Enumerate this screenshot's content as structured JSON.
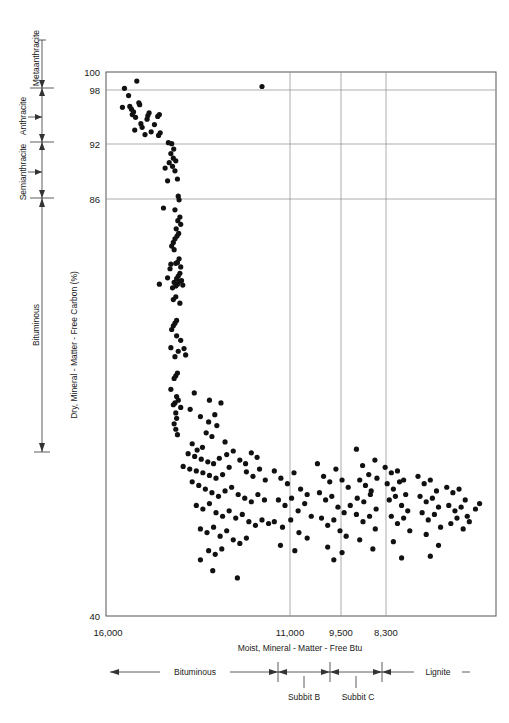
{
  "chart_data": {
    "type": "scatter",
    "title": "",
    "xlabel": "Moist, Mineral - Matter - Free Btu",
    "ylabel": "Dry, Mineral - Matter - Free Carbon (%)",
    "xlim": [
      16000,
      6500
    ],
    "ylim": [
      40,
      100
    ],
    "x_reversed": true,
    "grid": true,
    "legend_position": "none",
    "xticks": [
      {
        "label": "16,000",
        "value": 16000
      },
      {
        "label": "11,000",
        "value": 11000
      },
      {
        "label": "9,500",
        "value": 9500
      },
      {
        "label": "8,300",
        "value": 8300
      }
    ],
    "yticks": [
      {
        "label": "100",
        "value": 100
      },
      {
        "label": "98",
        "value": 98
      },
      {
        "label": "92",
        "value": 92
      },
      {
        "label": "86",
        "value": 86
      },
      {
        "label": "40",
        "value": 40
      }
    ],
    "gridlines_y": [
      98,
      92,
      86
    ],
    "gridlines_x": [
      11000,
      9500,
      8300
    ],
    "rank_axis_left": {
      "categories": [
        {
          "label": "Metaanthracite",
          "min": 98,
          "max": 100
        },
        {
          "label": "Anthracite",
          "min": 92,
          "max": 98
        },
        {
          "label": "Semianthracite",
          "min": 86,
          "max": 92
        },
        {
          "label": "Bituminous",
          "min": 40,
          "max": 86
        }
      ]
    },
    "rank_axis_bottom": {
      "categories": [
        {
          "label": "Bituminous",
          "from": 16000,
          "to": 10500
        },
        {
          "label": "Subbit B",
          "from": 10500,
          "to": 9500
        },
        {
          "label": "Subbit C",
          "from": 9500,
          "to": 8300
        },
        {
          "label": "Lignite",
          "from": 8300,
          "to": 6500
        }
      ]
    },
    "series": [
      {
        "name": "coal samples",
        "marker": "filled-circle",
        "color": "#111111",
        "points": [
          [
            15550,
            98.2
          ],
          [
            15250,
            99.0
          ],
          [
            15450,
            97.4
          ],
          [
            15200,
            96.6
          ],
          [
            15180,
            96.4
          ],
          [
            15420,
            96.2
          ],
          [
            15600,
            96.1
          ],
          [
            15380,
            95.9
          ],
          [
            15330,
            95.6
          ],
          [
            15360,
            95.3
          ],
          [
            15280,
            95.0
          ],
          [
            14950,
            95.5
          ],
          [
            14980,
            95.2
          ],
          [
            15000,
            94.8
          ],
          [
            14700,
            95.3
          ],
          [
            14740,
            95.1
          ],
          [
            15150,
            94.3
          ],
          [
            15120,
            93.9
          ],
          [
            14820,
            94.2
          ],
          [
            15300,
            93.6
          ],
          [
            14680,
            93.3
          ],
          [
            14720,
            93.0
          ],
          [
            14900,
            93.4
          ],
          [
            15050,
            93.1
          ],
          [
            14400,
            92.1
          ],
          [
            14480,
            92.2
          ],
          [
            14350,
            91.5
          ],
          [
            14420,
            91.0
          ],
          [
            14360,
            90.5
          ],
          [
            14300,
            90.2
          ],
          [
            14460,
            90.0
          ],
          [
            14380,
            89.6
          ],
          [
            14320,
            89.1
          ],
          [
            14560,
            89.4
          ],
          [
            14260,
            88.2
          ],
          [
            14500,
            88.0
          ],
          [
            14240,
            86.3
          ],
          [
            14220,
            85.9
          ],
          [
            14320,
            84.8
          ],
          [
            14600,
            85.0
          ],
          [
            14200,
            84.0
          ],
          [
            14250,
            83.6
          ],
          [
            14180,
            83.2
          ],
          [
            14290,
            82.7
          ],
          [
            14230,
            82.2
          ],
          [
            14270,
            81.9
          ],
          [
            14320,
            81.6
          ],
          [
            14360,
            81.2
          ],
          [
            14400,
            80.8
          ],
          [
            14340,
            80.4
          ],
          [
            14220,
            79.4
          ],
          [
            14260,
            79.0
          ],
          [
            14300,
            78.9
          ],
          [
            14180,
            78.5
          ],
          [
            14420,
            78.8
          ],
          [
            14440,
            78.3
          ],
          [
            14200,
            77.8
          ],
          [
            14240,
            77.5
          ],
          [
            14280,
            77.2
          ],
          [
            14220,
            76.9
          ],
          [
            14260,
            76.6
          ],
          [
            14300,
            76.4
          ],
          [
            14340,
            76.8
          ],
          [
            14380,
            76.2
          ],
          [
            14160,
            77.0
          ],
          [
            14500,
            77.3
          ],
          [
            14130,
            76.5
          ],
          [
            14700,
            76.6
          ],
          [
            14300,
            75.2
          ],
          [
            14360,
            74.9
          ],
          [
            14200,
            74.5
          ],
          [
            14280,
            72.6
          ],
          [
            14320,
            72.3
          ],
          [
            14360,
            72.0
          ],
          [
            14400,
            71.6
          ],
          [
            14280,
            70.9
          ],
          [
            14180,
            70.4
          ],
          [
            14100,
            69.5
          ],
          [
            14240,
            69.2
          ],
          [
            14420,
            69.6
          ],
          [
            14320,
            68.6
          ],
          [
            14060,
            68.8
          ],
          [
            14260,
            66.8
          ],
          [
            14300,
            66.5
          ],
          [
            14340,
            66.2
          ],
          [
            14420,
            65.0
          ],
          [
            14280,
            64.2
          ],
          [
            14240,
            63.8
          ],
          [
            14320,
            63.5
          ],
          [
            14180,
            63.0
          ],
          [
            14360,
            63.3
          ],
          [
            14300,
            62.4
          ],
          [
            14280,
            61.8
          ],
          [
            14340,
            61.2
          ],
          [
            14300,
            60.6
          ],
          [
            14260,
            60.0
          ],
          [
            13850,
            64.6
          ],
          [
            13700,
            62.0
          ],
          [
            13500,
            61.4
          ],
          [
            13300,
            61.0
          ],
          [
            13200,
            63.5
          ],
          [
            13560,
            60.2
          ],
          [
            13420,
            59.8
          ],
          [
            13100,
            59.2
          ],
          [
            13900,
            59.0
          ],
          [
            13650,
            58.6
          ],
          [
            13780,
            58.3
          ],
          [
            13480,
            63.8
          ],
          [
            13950,
            62.8
          ],
          [
            13350,
            62.2
          ],
          [
            14000,
            57.9
          ],
          [
            13840,
            57.6
          ],
          [
            13680,
            57.3
          ],
          [
            13520,
            57.0
          ],
          [
            13240,
            57.4
          ],
          [
            13380,
            56.8
          ],
          [
            14120,
            56.5
          ],
          [
            13960,
            56.2
          ],
          [
            13800,
            56.0
          ],
          [
            13640,
            55.8
          ],
          [
            13480,
            55.5
          ],
          [
            13320,
            55.2
          ],
          [
            13160,
            55.6
          ],
          [
            13000,
            56.4
          ],
          [
            13060,
            57.8
          ],
          [
            12900,
            58.2
          ],
          [
            12740,
            57.2
          ],
          [
            12600,
            56.8
          ],
          [
            12460,
            58.0
          ],
          [
            12320,
            57.5
          ],
          [
            12580,
            55.9
          ],
          [
            12420,
            55.4
          ],
          [
            12260,
            56.2
          ],
          [
            12120,
            55.0
          ],
          [
            13900,
            54.8
          ],
          [
            13740,
            54.4
          ],
          [
            13580,
            54.0
          ],
          [
            13420,
            53.6
          ],
          [
            13260,
            53.2
          ],
          [
            13100,
            53.8
          ],
          [
            12940,
            54.2
          ],
          [
            12780,
            53.4
          ],
          [
            12620,
            53.0
          ],
          [
            12460,
            52.6
          ],
          [
            12300,
            53.4
          ],
          [
            12140,
            52.8
          ],
          [
            13800,
            52.2
          ],
          [
            13640,
            51.8
          ],
          [
            13480,
            52.4
          ],
          [
            13320,
            51.4
          ],
          [
            13160,
            51.0
          ],
          [
            13000,
            51.6
          ],
          [
            12840,
            50.8
          ],
          [
            12680,
            51.2
          ],
          [
            12520,
            50.4
          ],
          [
            12360,
            50.0
          ],
          [
            12200,
            50.6
          ],
          [
            12040,
            50.2
          ],
          [
            13700,
            49.6
          ],
          [
            13540,
            49.2
          ],
          [
            13380,
            49.8
          ],
          [
            13220,
            48.8
          ],
          [
            13060,
            49.4
          ],
          [
            12900,
            48.4
          ],
          [
            12740,
            48.0
          ],
          [
            12580,
            48.6
          ],
          [
            13500,
            47.2
          ],
          [
            13340,
            46.8
          ],
          [
            13180,
            47.4
          ],
          [
            13700,
            46.2
          ],
          [
            13400,
            45.0
          ],
          [
            12800,
            44.2
          ],
          [
            11900,
            56.0
          ],
          [
            11740,
            55.2
          ],
          [
            11580,
            54.6
          ],
          [
            11420,
            55.8
          ],
          [
            11260,
            54.0
          ],
          [
            11100,
            53.4
          ],
          [
            11800,
            52.8
          ],
          [
            11640,
            52.2
          ],
          [
            11480,
            53.0
          ],
          [
            11320,
            51.6
          ],
          [
            11160,
            52.4
          ],
          [
            11000,
            51.0
          ],
          [
            11900,
            50.4
          ],
          [
            11700,
            49.8
          ],
          [
            11500,
            50.6
          ],
          [
            11300,
            49.2
          ],
          [
            11100,
            48.6
          ],
          [
            11750,
            47.8
          ],
          [
            11400,
            47.2
          ],
          [
            10850,
            56.8
          ],
          [
            10700,
            55.4
          ],
          [
            10550,
            54.8
          ],
          [
            10400,
            56.2
          ],
          [
            10250,
            55.0
          ],
          [
            10100,
            54.2
          ],
          [
            10800,
            53.6
          ],
          [
            10650,
            52.8
          ],
          [
            10500,
            53.2
          ],
          [
            10350,
            52.0
          ],
          [
            10200,
            51.4
          ],
          [
            10050,
            52.2
          ],
          [
            10750,
            50.8
          ],
          [
            10600,
            50.0
          ],
          [
            10450,
            50.6
          ],
          [
            10300,
            49.4
          ],
          [
            10150,
            48.8
          ],
          [
            10600,
            47.6
          ],
          [
            10250,
            47.0
          ],
          [
            10450,
            46.2
          ],
          [
            9900,
            58.4
          ],
          [
            9750,
            56.6
          ],
          [
            9600,
            55.6
          ],
          [
            9450,
            57.2
          ],
          [
            9820,
            55.0
          ],
          [
            9680,
            54.4
          ],
          [
            9540,
            53.8
          ],
          [
            9400,
            55.2
          ],
          [
            9880,
            53.0
          ],
          [
            9720,
            52.6
          ],
          [
            9560,
            53.4
          ],
          [
            9420,
            51.8
          ],
          [
            9900,
            51.2
          ],
          [
            9740,
            50.4
          ],
          [
            9580,
            51.0
          ],
          [
            9440,
            49.6
          ],
          [
            9820,
            48.4
          ],
          [
            9500,
            47.4
          ],
          [
            9200,
            56.4
          ],
          [
            9050,
            55.8
          ],
          [
            8900,
            56.0
          ],
          [
            8750,
            55.0
          ],
          [
            9150,
            54.6
          ],
          [
            9000,
            54.0
          ],
          [
            8850,
            54.8
          ],
          [
            8700,
            53.4
          ],
          [
            9100,
            52.8
          ],
          [
            8950,
            53.2
          ],
          [
            8800,
            52.2
          ],
          [
            8650,
            51.6
          ],
          [
            9050,
            51.0
          ],
          [
            8900,
            50.2
          ],
          [
            8750,
            50.8
          ],
          [
            8600,
            49.4
          ],
          [
            9000,
            48.2
          ],
          [
            8800,
            46.4
          ],
          [
            8400,
            55.4
          ],
          [
            8250,
            54.6
          ],
          [
            8100,
            55.0
          ],
          [
            7950,
            53.8
          ],
          [
            8350,
            53.2
          ],
          [
            8200,
            52.6
          ],
          [
            8050,
            53.0
          ],
          [
            7900,
            52.0
          ],
          [
            8300,
            51.4
          ],
          [
            8150,
            50.6
          ],
          [
            8000,
            51.2
          ],
          [
            7850,
            49.8
          ],
          [
            8200,
            49.0
          ],
          [
            7900,
            47.8
          ],
          [
            8100,
            46.6
          ],
          [
            7700,
            54.2
          ],
          [
            7550,
            53.6
          ],
          [
            7400,
            54.0
          ],
          [
            7250,
            52.8
          ],
          [
            7650,
            52.2
          ],
          [
            7500,
            51.6
          ],
          [
            7350,
            52.0
          ],
          [
            7200,
            51.0
          ],
          [
            7600,
            50.2
          ],
          [
            7450,
            50.8
          ],
          [
            7300,
            49.6
          ],
          [
            7150,
            50.4
          ],
          [
            7000,
            51.8
          ],
          [
            6900,
            52.4
          ],
          [
            12200,
            98.4
          ]
        ]
      }
    ]
  },
  "labels": {
    "yaxis_title": "Dry, Mineral - Matter - Free Carbon (%)",
    "xaxis_title": "Moist, Mineral - Matter - Free Btu",
    "left_rank_metaanthracite": "Metaanthracite",
    "left_rank_anthracite": "Anthracite",
    "left_rank_semianthracite": "Semianthracite",
    "left_rank_bituminous": "Bituminous",
    "bottom_rank_bituminous": "Bituminous",
    "bottom_rank_subbit_b": "Subbit B",
    "bottom_rank_subbit_c": "Subbit C",
    "bottom_rank_lignite": "Lignite",
    "ytick_100": "100",
    "ytick_98": "98",
    "ytick_92": "92",
    "ytick_86": "86",
    "ytick_40": "40",
    "xtick_16000": "16,000",
    "xtick_11000": "11,000",
    "xtick_9500": "9,500",
    "xtick_8300": "8,300"
  },
  "colors": {
    "marker": "#111111",
    "frame": "#555555",
    "grid": "#8a8a8a",
    "text": "#1a1a1a",
    "background": "#ffffff"
  }
}
